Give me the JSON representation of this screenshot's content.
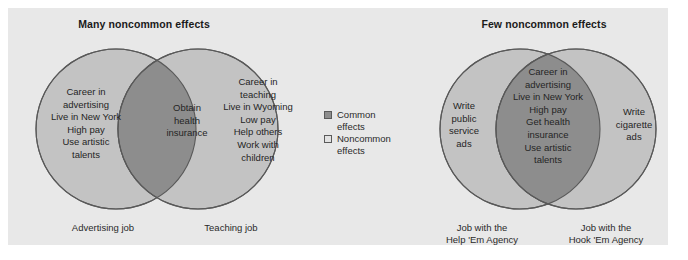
{
  "figure": {
    "background_color": "#e8e8e8",
    "circle_fill": "#c3c3c3",
    "overlap_fill": "#8d8d8d",
    "stroke_color": "#595959"
  },
  "panels": [
    {
      "id": "many-noncommon",
      "title": "Many noncommon effects",
      "left_set": {
        "label": "Advertising job",
        "unique_effects": "Career in\nadvertising\nLive in New York\nHigh pay\nUse artistic\ntalents"
      },
      "right_set": {
        "label": "Teaching job",
        "unique_effects": "Career in\nteaching\nLive in Wyoming\nLow pay\nHelp others\nWork with\nchildren"
      },
      "overlap": {
        "common_effects": "Obtain\nhealth\ninsurance"
      }
    },
    {
      "id": "few-noncommon",
      "title": "Few noncommon effects",
      "left_set": {
        "label": "Job with the\nHelp 'Em Agency",
        "unique_effects": "Write\npublic\nservice\nads"
      },
      "right_set": {
        "label": "Job with the\nHook 'Em Agency",
        "unique_effects": "Write\ncigarette\nads"
      },
      "overlap": {
        "common_effects": "Career in\nadvertising\nLive in New York\nHigh pay\nGet health\ninsurance\nUse artistic\ntalents"
      }
    }
  ],
  "legend": {
    "items": [
      {
        "swatch": "common-swatch",
        "label": "Common\neffects",
        "color": "#8d8d8d"
      },
      {
        "swatch": "noncommon-swatch",
        "label": "Noncommon\neffects",
        "color": "#e2e2e2"
      }
    ]
  }
}
